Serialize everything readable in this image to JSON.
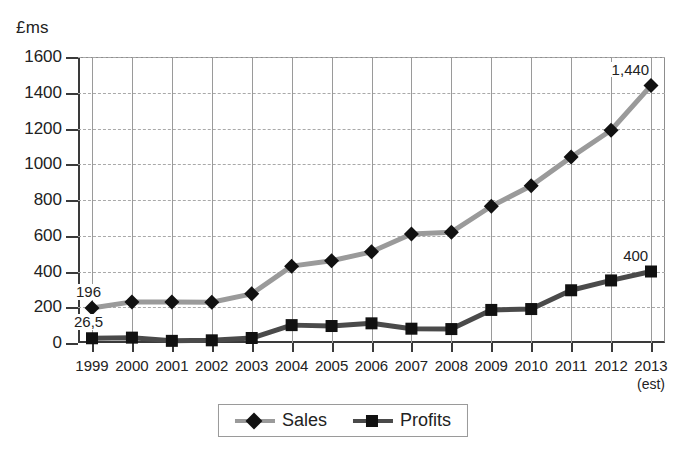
{
  "chart_data": {
    "type": "line",
    "title": "",
    "ylabel": "£ms",
    "xlabel": "",
    "ylim": [
      0,
      1600
    ],
    "yticks": [
      0,
      200,
      400,
      600,
      800,
      1000,
      1200,
      1400,
      1600
    ],
    "ytick_labels": [
      "0",
      "200",
      "400",
      "600",
      "800",
      "1000",
      "1200",
      "1400",
      "1600"
    ],
    "categories": [
      "1999",
      "2000",
      "2001",
      "2002",
      "2003",
      "2004",
      "2005",
      "2006",
      "2007",
      "2008",
      "2009",
      "2010",
      "2011",
      "2012",
      "2013"
    ],
    "x_note_last": "(est)",
    "grid": "both",
    "legend_position": "bottom",
    "series": [
      {
        "name": "Sales",
        "marker": "diamond",
        "color": "#9a9a9a",
        "marker_color": "#111111",
        "values": [
          196,
          230,
          230,
          228,
          275,
          430,
          460,
          510,
          610,
          620,
          765,
          880,
          1040,
          1190,
          1440
        ]
      },
      {
        "name": "Profits",
        "marker": "square",
        "color": "#4a4a4a",
        "marker_color": "#111111",
        "values": [
          26.5,
          30,
          12,
          15,
          28,
          100,
          95,
          110,
          80,
          78,
          185,
          190,
          295,
          350,
          400
        ]
      }
    ],
    "annotations": [
      {
        "text": "196",
        "series": "Sales",
        "category": "1999",
        "position": "above"
      },
      {
        "text": "26,5",
        "series": "Profits",
        "category": "1999",
        "position": "above"
      },
      {
        "text": "1,440",
        "series": "Sales",
        "category": "2013",
        "position": "above"
      },
      {
        "text": "400",
        "series": "Profits",
        "category": "2013",
        "position": "above"
      }
    ]
  },
  "legend": {
    "items": [
      {
        "label": "Sales"
      },
      {
        "label": "Profits"
      }
    ]
  },
  "colors": {
    "sales_line": "#9a9a9a",
    "profits_line": "#4a4a4a",
    "marker": "#111111",
    "axis": "#3a3a3a",
    "grid": "#a9a9a9",
    "text": "#222222",
    "background": "#ffffff"
  }
}
